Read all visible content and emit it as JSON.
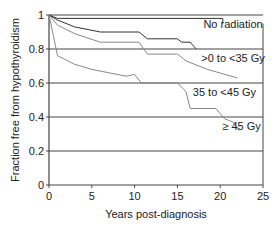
{
  "chart_data": {
    "type": "line",
    "title": "",
    "xlabel": "Years post-diagnosis",
    "ylabel": "Fraction free from hypothyroidism",
    "xlim": [
      0,
      25
    ],
    "ylim": [
      0,
      1
    ],
    "xticks": [
      0,
      5,
      10,
      15,
      20,
      25
    ],
    "yticks": [
      0,
      0.2,
      0.4,
      0.6,
      0.8,
      1
    ],
    "ytick_labels": [
      "0",
      "0.2",
      "0.4",
      "0.6",
      "0.8",
      "1"
    ],
    "grid": "horizontal",
    "legend": "inline labels",
    "series": [
      {
        "name": "No radiation",
        "color": "#333333",
        "points": [
          [
            0,
            1.0
          ],
          [
            0.5,
            0.99
          ],
          [
            1,
            0.98
          ],
          [
            20.3,
            0.98
          ],
          [
            20.3,
            0.95
          ]
        ]
      },
      {
        "name": ">0 to <35 Gy",
        "color": "#333333",
        "points": [
          [
            0,
            1.0
          ],
          [
            1,
            0.97
          ],
          [
            3,
            0.93
          ],
          [
            6,
            0.9
          ],
          [
            10.5,
            0.9
          ],
          [
            11.5,
            0.86
          ],
          [
            15,
            0.86
          ],
          [
            15.5,
            0.84
          ],
          [
            16.5,
            0.84
          ],
          [
            17.2,
            0.8
          ]
        ]
      },
      {
        "name": "35 to <45 Gy",
        "color": "#888888",
        "points": [
          [
            0,
            1.0
          ],
          [
            1,
            0.94
          ],
          [
            3,
            0.89
          ],
          [
            6,
            0.84
          ],
          [
            10.5,
            0.84
          ],
          [
            11.5,
            0.77
          ],
          [
            15,
            0.77
          ],
          [
            16,
            0.73
          ],
          [
            18.5,
            0.68
          ],
          [
            22,
            0.63
          ]
        ]
      },
      {
        "name": "≥ 45 Gy",
        "color": "#888888",
        "points": [
          [
            0,
            1.0
          ],
          [
            0.5,
            0.88
          ],
          [
            1,
            0.76
          ],
          [
            3,
            0.71
          ],
          [
            5,
            0.68
          ],
          [
            7,
            0.66
          ],
          [
            9,
            0.64
          ],
          [
            10,
            0.65
          ],
          [
            10.8,
            0.6
          ],
          [
            15,
            0.6
          ],
          [
            16,
            0.55
          ],
          [
            16.5,
            0.45
          ],
          [
            19.5,
            0.45
          ],
          [
            20.5,
            0.39
          ],
          [
            21.5,
            0.37
          ],
          [
            22.2,
            0.32
          ]
        ]
      }
    ],
    "annotations": [
      {
        "text": "No radiation",
        "x": 21.5,
        "y": 0.95
      },
      {
        "text": ">0 to <35 Gy",
        "x": 21.5,
        "y": 0.75
      },
      {
        "text": "35 to <45 Gy",
        "x": 20.5,
        "y": 0.55
      },
      {
        "text": "≥ 45 Gy",
        "x": 22.5,
        "y": 0.35
      }
    ]
  }
}
